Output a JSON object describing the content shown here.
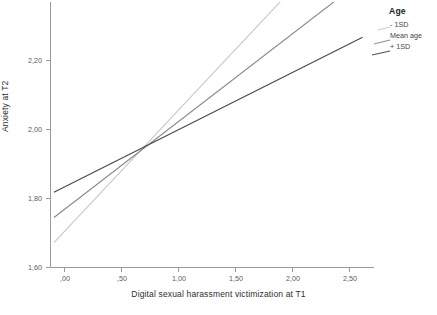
{
  "chart_data": {
    "type": "line",
    "title": "",
    "xlabel": "Digital sexual harassment victimization at T1",
    "ylabel": "Anxiety at T2",
    "xticks": [
      ",00",
      ",50",
      "1,00",
      "1,50",
      "2,00",
      "2,50"
    ],
    "xtick_values": [
      0.0,
      0.5,
      1.0,
      1.5,
      2.0,
      2.5
    ],
    "yticks": [
      "1,60",
      "1,80",
      "2,00",
      "2,20"
    ],
    "ytick_values": [
      1.6,
      1.8,
      2.0,
      2.2
    ],
    "xlim": [
      -0.12,
      2.72
    ],
    "ylim": [
      1.56,
      2.33
    ],
    "grid": false,
    "legend": {
      "title": "Age",
      "position": "top-right",
      "entries": [
        {
          "label": "- 1SD",
          "color": "#c9c9c9"
        },
        {
          "label": "Mean age",
          "color": "#8a8a8a"
        },
        {
          "label": "+ 1SD",
          "color": "#4a4a4a"
        }
      ]
    },
    "series": [
      {
        "name": "- 1SD",
        "color": "#c9c9c9",
        "x": [
          -0.09,
          2.72
        ],
        "y": [
          1.632,
          2.62
        ],
        "intercept": 1.664,
        "slope": 0.352,
        "clipped_at_top": true
      },
      {
        "name": "Mean age",
        "color": "#8a8a8a",
        "x": [
          -0.09,
          2.72
        ],
        "y": [
          1.705,
          2.42
        ],
        "intercept": 1.728,
        "slope": 0.254,
        "clipped_at_top": true
      },
      {
        "name": "+ 1SD",
        "color": "#4a4a4a",
        "x": [
          -0.09,
          2.62
        ],
        "y": [
          1.778,
          2.228
        ],
        "intercept": 1.794,
        "slope": 0.166,
        "clipped_at_top": false
      }
    ],
    "crossing_point": {
      "x": 0.82,
      "y": 1.935
    },
    "axis_color": "#9a9a9a",
    "background": "#ffffff"
  }
}
